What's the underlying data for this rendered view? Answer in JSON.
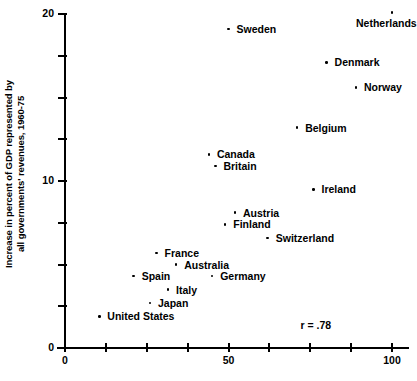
{
  "chart_data": {
    "type": "scatter",
    "title": "",
    "xlabel": "",
    "ylabel": "Increase in percent of GDP represented by all governments' revenues, 1960-75",
    "ylabel_lines": [
      "Increase in percent of GDP represented by",
      "all governments' revenues, 1960-75"
    ],
    "xlim": [
      0,
      100
    ],
    "ylim": [
      0,
      20
    ],
    "x_ticks": [
      0,
      12.5,
      25,
      37.5,
      50,
      62.5,
      75,
      87.5,
      100
    ],
    "x_tick_labels": [
      {
        "value": 0,
        "label": "0"
      },
      {
        "value": 50,
        "label": "50"
      },
      {
        "value": 100,
        "label": "100"
      }
    ],
    "y_ticks": [
      0,
      2.5,
      5,
      7.5,
      10,
      12.5,
      15,
      17.5,
      20
    ],
    "y_tick_labels": [
      {
        "value": 0,
        "label": "0"
      },
      {
        "value": 10,
        "label": "10"
      },
      {
        "value": 20,
        "label": "20"
      }
    ],
    "grid": false,
    "legend": "none",
    "annotations": [
      {
        "name": "correlation",
        "text": "r = .78",
        "x": 72,
        "y": 1.4
      }
    ],
    "points": [
      {
        "label": "Sweden",
        "x": 50.0,
        "y": 19.1,
        "label_side": "right"
      },
      {
        "label": "Netherlands",
        "x": 100.0,
        "y": 20.1,
        "label_side": "below"
      },
      {
        "label": "Denmark",
        "x": 80.0,
        "y": 17.1,
        "label_side": "right"
      },
      {
        "label": "Norway",
        "x": 89.0,
        "y": 15.6,
        "label_side": "right"
      },
      {
        "label": "Belgium",
        "x": 71.0,
        "y": 13.2,
        "label_side": "right"
      },
      {
        "label": "Canada",
        "x": 44.0,
        "y": 11.6,
        "label_side": "right"
      },
      {
        "label": "Britain",
        "x": 46.0,
        "y": 10.9,
        "label_side": "right"
      },
      {
        "label": "Ireland",
        "x": 76.0,
        "y": 9.5,
        "label_side": "right"
      },
      {
        "label": "Austria",
        "x": 52.0,
        "y": 8.1,
        "label_side": "right"
      },
      {
        "label": "Finland",
        "x": 49.0,
        "y": 7.4,
        "label_side": "right"
      },
      {
        "label": "Switzerland",
        "x": 62.0,
        "y": 6.6,
        "label_side": "right"
      },
      {
        "label": "France",
        "x": 28.0,
        "y": 5.7,
        "label_side": "right"
      },
      {
        "label": "Australia",
        "x": 34.0,
        "y": 5.0,
        "label_side": "right"
      },
      {
        "label": "Spain",
        "x": 21.0,
        "y": 4.3,
        "label_side": "right"
      },
      {
        "label": "Germany",
        "x": 45.0,
        "y": 4.3,
        "label_side": "right"
      },
      {
        "label": "Italy",
        "x": 31.5,
        "y": 3.5,
        "label_side": "right"
      },
      {
        "label": "Japan",
        "x": 26.0,
        "y": 2.7,
        "label_side": "right"
      },
      {
        "label": "United States",
        "x": 10.5,
        "y": 1.9,
        "label_side": "right"
      }
    ]
  }
}
